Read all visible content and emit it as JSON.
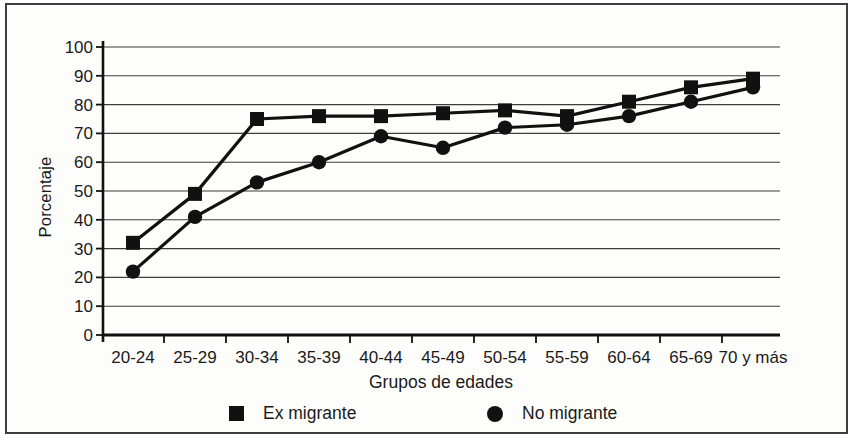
{
  "window": {
    "background": "#ffffff",
    "frame_color": "#3f3f3f"
  },
  "chart_data": {
    "type": "line",
    "title": "",
    "xlabel": "Grupos de edades",
    "ylabel": "Porcentaje",
    "categories": [
      "20-24",
      "25-29",
      "30-34",
      "35-39",
      "40-44",
      "45-49",
      "50-54",
      "55-59",
      "60-64",
      "65-69",
      "70 y más"
    ],
    "series": [
      {
        "name": "Ex migrante",
        "marker": "square",
        "color": "#111111",
        "values": [
          32,
          49,
          75,
          76,
          76,
          77,
          78,
          76,
          81,
          86,
          89
        ]
      },
      {
        "name": "No migrante",
        "marker": "circle",
        "color": "#111111",
        "values": [
          22,
          41,
          53,
          60,
          69,
          65,
          72,
          73,
          76,
          81,
          86
        ]
      }
    ],
    "ylim": [
      0,
      100
    ],
    "yticks": [
      0,
      10,
      20,
      30,
      40,
      50,
      60,
      70,
      80,
      90,
      100
    ],
    "grid": "horizontal",
    "grid_color": "#3d3d3d",
    "axis_color": "#111111",
    "text_color": "#1a1a1a",
    "legend_position": "bottom"
  }
}
